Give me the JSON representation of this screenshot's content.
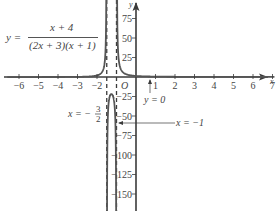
{
  "chart_data": {
    "type": "line",
    "title": "",
    "function_label": "y = (x + 4) / ((2x + 3)(x + 1))",
    "equation": {
      "lhs": "y =",
      "numerator": "x + 4",
      "denominator": "(2x + 3)(x + 1)"
    },
    "xlabel": "x",
    "ylabel": "y",
    "origin_label": "O",
    "xlim": [
      -6.5,
      7.3
    ],
    "ylim": [
      -160,
      95
    ],
    "x_ticks": [
      -6,
      -5,
      -4,
      -3,
      -2,
      1,
      2,
      3,
      4,
      5,
      6,
      7
    ],
    "x_tick_labels": [
      "−6",
      "−5",
      "−4",
      "−3",
      "−2",
      "1",
      "2",
      "3",
      "4",
      "5",
      "6",
      "7"
    ],
    "y_ticks": [
      75,
      50,
      25,
      -25,
      -50,
      -75,
      -100,
      -125,
      -150
    ],
    "y_tick_labels": [
      "75",
      "50",
      "25",
      "−25",
      "−50",
      "−75",
      "−100",
      "−125",
      "−150"
    ],
    "grid": false,
    "asymptotes": [
      {
        "type": "vertical",
        "x": -1.5,
        "label": "x = − 3/2",
        "style": "dashed"
      },
      {
        "type": "vertical",
        "x": -1,
        "label": "x = −1",
        "style": "dashed"
      },
      {
        "type": "horizontal",
        "y": 0,
        "label": "y = 0"
      }
    ],
    "annotations": [
      {
        "text": "x = − 3/2",
        "points_to": "vertical asymptote x = -1.5"
      },
      {
        "text": "x = −1",
        "points_to": "vertical asymptote x = -1"
      },
      {
        "text": "y = 0",
        "points_to": "horizontal asymptote y = 0"
      }
    ],
    "series": [
      {
        "name": "left branch (x < -1.5)",
        "x": [
          -6.5,
          -6,
          -5,
          -4,
          -3,
          -2.5,
          -2,
          -1.8,
          -1.7,
          -1.65
        ],
        "y": [
          -0.03,
          -0.03,
          -0.04,
          0,
          0.17,
          0.5,
          2,
          4.55,
          8.15,
          14.6
        ]
      },
      {
        "name": "middle branch (-1.5 < x < -1)",
        "x": [
          -1.48,
          -1.45,
          -1.4,
          -1.3,
          -1.25,
          -1.2,
          -1.1,
          -1.05,
          -1.02
        ],
        "y": [
          -257,
          -105,
          -54,
          -23.8,
          -20.6,
          -23,
          -39.3,
          -73.4,
          -173
        ]
      },
      {
        "name": "right branch (x > -1)",
        "x": [
          -0.94,
          -0.9,
          -0.8,
          -0.6,
          -0.4,
          0,
          0.5,
          1,
          2,
          3,
          5,
          7
        ],
        "y": [
          75,
          39,
          15.2,
          6.8,
          3.6,
          1.33,
          0.56,
          0.33,
          0.13,
          0.08,
          0.04,
          0.03
        ]
      }
    ]
  }
}
